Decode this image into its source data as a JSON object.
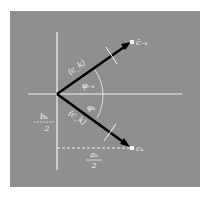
{
  "diagram": {
    "background_color": "#8f8f8f",
    "axis_color": "#f2f2f2",
    "vector_color": "#000000",
    "labels": {
      "vector_upper": "⟨c_k⟩",
      "vector_lower": "⟨c_k⟩",
      "angle_upper": "φ₋ₖ",
      "angle_lower": "φₖ",
      "endpoint_upper": "c̄₋ₖ",
      "endpoint_lower": "cₖ",
      "b_numerator": "bₖ",
      "b_denominator": "2",
      "a_numerator": "aₖ",
      "a_denominator": "2"
    }
  }
}
